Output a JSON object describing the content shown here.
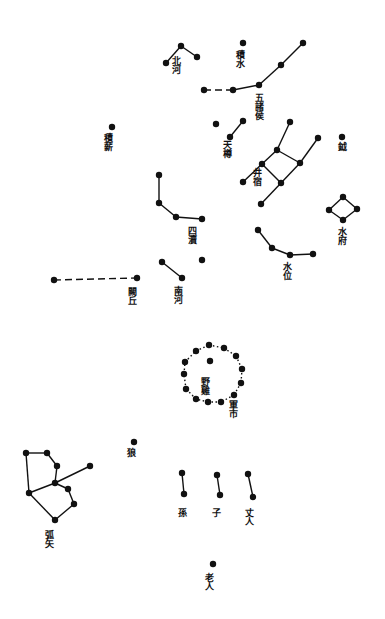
{
  "colors": {
    "ink": "#111111",
    "paper": "#ffffff"
  },
  "star_radius": 3.2,
  "asterisms": [
    {
      "id": "beihe",
      "label": "北河",
      "label_pos": [
        176,
        56
      ],
      "stars": [
        [
          166,
          63
        ],
        [
          181,
          46
        ],
        [
          197,
          57
        ]
      ],
      "lines": [
        [
          0,
          1
        ],
        [
          1,
          2
        ]
      ]
    },
    {
      "id": "jishui",
      "label": "積水",
      "label_pos": [
        240,
        50
      ],
      "stars": [
        [
          243,
          43
        ]
      ],
      "lines": []
    },
    {
      "id": "wuzhuhou",
      "label": "五諸侯",
      "label_pos": [
        259,
        93
      ],
      "stars": [
        [
          204,
          90
        ],
        [
          233,
          90
        ],
        [
          259,
          85
        ],
        [
          281,
          65
        ],
        [
          303,
          43
        ]
      ],
      "lines": [
        [
          0,
          1
        ],
        [
          1,
          2
        ],
        [
          2,
          3
        ],
        [
          3,
          4
        ]
      ],
      "dashed": [
        [
          0,
          1
        ]
      ]
    },
    {
      "id": "jixin",
      "label": "積薪",
      "label_pos": [
        108,
        133
      ],
      "stars": [
        [
          112,
          127
        ]
      ],
      "lines": []
    },
    {
      "id": "tianzun",
      "label": "天樽",
      "label_pos": [
        227,
        140
      ],
      "stars": [
        [
          216,
          124
        ],
        [
          243,
          121
        ],
        [
          230,
          137
        ]
      ],
      "lines": [
        [
          1,
          2
        ]
      ]
    },
    {
      "id": "jing",
      "label": "井宿",
      "label_pos": [
        257,
        168
      ],
      "stars": [
        [
          290,
          122
        ],
        [
          277,
          150
        ],
        [
          262,
          164
        ],
        [
          243,
          182
        ],
        [
          281,
          183
        ],
        [
          300,
          163
        ],
        [
          318,
          138
        ],
        [
          261,
          204
        ]
      ],
      "lines": [
        [
          0,
          1
        ],
        [
          1,
          2
        ],
        [
          2,
          3
        ],
        [
          1,
          5
        ],
        [
          2,
          4
        ],
        [
          4,
          5
        ],
        [
          5,
          6
        ],
        [
          4,
          7
        ]
      ]
    },
    {
      "id": "yue",
      "label": "鉞",
      "label_pos": [
        342,
        142
      ],
      "stars": [
        [
          342,
          137
        ]
      ],
      "lines": []
    },
    {
      "id": "shuifu",
      "label": "水府",
      "label_pos": [
        342,
        227
      ],
      "stars": [
        [
          343,
          197
        ],
        [
          357,
          209
        ],
        [
          343,
          220
        ],
        [
          329,
          210
        ]
      ],
      "lines": [
        [
          0,
          1
        ],
        [
          1,
          2
        ],
        [
          2,
          3
        ],
        [
          3,
          0
        ]
      ]
    },
    {
      "id": "sidu",
      "label": "四瀆",
      "label_pos": [
        192,
        226
      ],
      "stars": [
        [
          159,
          175
        ],
        [
          159,
          203
        ],
        [
          176,
          217
        ],
        [
          202,
          219
        ]
      ],
      "lines": [
        [
          0,
          1
        ],
        [
          1,
          2
        ],
        [
          2,
          3
        ]
      ]
    },
    {
      "id": "shuiwei",
      "label": "水位",
      "label_pos": [
        287,
        262
      ],
      "stars": [
        [
          258,
          230
        ],
        [
          272,
          248
        ],
        [
          290,
          255
        ],
        [
          313,
          254
        ]
      ],
      "lines": [
        [
          0,
          1
        ],
        [
          1,
          2
        ],
        [
          3,
          2
        ]
      ]
    },
    {
      "id": "nanhe",
      "label": "南河",
      "label_pos": [
        178,
        286
      ],
      "stars": [
        [
          162,
          262
        ],
        [
          182,
          278
        ],
        [
          202,
          260
        ]
      ],
      "lines": [
        [
          0,
          1
        ]
      ]
    },
    {
      "id": "queqiu",
      "label": "闕丘",
      "label_pos": [
        132,
        287
      ],
      "stars": [
        [
          54,
          280
        ],
        [
          137,
          278
        ]
      ],
      "lines": [
        [
          0,
          1
        ]
      ],
      "dashed": [
        [
          0,
          1
        ]
      ]
    },
    {
      "id": "yeji",
      "label": "野雞",
      "label_pos": [
        205,
        377
      ],
      "stars": [
        [
          210,
          361
        ]
      ],
      "lines": []
    },
    {
      "id": "junshi",
      "label": "軍市",
      "label_pos": [
        233,
        400
      ],
      "stars": [
        [
          209,
          345
        ],
        [
          224,
          348
        ],
        [
          236,
          356
        ],
        [
          242,
          369
        ],
        [
          241,
          383
        ],
        [
          234,
          395
        ],
        [
          221,
          402
        ],
        [
          208,
          402
        ],
        [
          196,
          399
        ],
        [
          186,
          389
        ],
        [
          184,
          374
        ],
        [
          185,
          362
        ],
        [
          196,
          351
        ]
      ],
      "lines": [
        [
          0,
          1
        ],
        [
          1,
          2
        ],
        [
          2,
          3
        ],
        [
          3,
          4
        ],
        [
          4,
          5
        ],
        [
          5,
          6
        ],
        [
          6,
          7
        ],
        [
          7,
          8
        ],
        [
          8,
          9
        ],
        [
          9,
          10
        ],
        [
          10,
          11
        ],
        [
          11,
          12
        ],
        [
          12,
          0
        ]
      ],
      "dotted": true
    },
    {
      "id": "lang",
      "label": "狼",
      "label_pos": [
        131,
        448
      ],
      "stars": [
        [
          134,
          442
        ]
      ],
      "lines": []
    },
    {
      "id": "hushi",
      "label": "弧矢",
      "label_pos": [
        49,
        530
      ],
      "stars": [
        [
          26,
          453
        ],
        [
          47,
          453
        ],
        [
          57,
          466
        ],
        [
          55,
          483
        ],
        [
          68,
          489
        ],
        [
          74,
          504
        ],
        [
          55,
          520
        ],
        [
          29,
          493
        ],
        [
          90,
          466
        ]
      ],
      "lines": [
        [
          0,
          1
        ],
        [
          1,
          2
        ],
        [
          2,
          3
        ],
        [
          3,
          4
        ],
        [
          4,
          5
        ],
        [
          5,
          6
        ],
        [
          6,
          7
        ],
        [
          7,
          0
        ],
        [
          3,
          7
        ],
        [
          8,
          3
        ]
      ]
    },
    {
      "id": "sun",
      "label": "孫",
      "label_pos": [
        182,
        508
      ],
      "stars": [
        [
          182,
          473
        ],
        [
          184,
          494
        ]
      ],
      "lines": [
        [
          0,
          1
        ]
      ]
    },
    {
      "id": "zi",
      "label": "子",
      "label_pos": [
        216,
        508
      ],
      "stars": [
        [
          217,
          475
        ],
        [
          220,
          495
        ]
      ],
      "lines": [
        [
          0,
          1
        ]
      ]
    },
    {
      "id": "zhangren",
      "label": "丈人",
      "label_pos": [
        249,
        508
      ],
      "stars": [
        [
          248,
          474
        ],
        [
          253,
          497
        ]
      ],
      "lines": [
        [
          0,
          1
        ]
      ]
    },
    {
      "id": "laoren",
      "label": "老人",
      "label_pos": [
        209,
        573
      ],
      "stars": [
        [
          213,
          564
        ]
      ],
      "lines": []
    }
  ]
}
